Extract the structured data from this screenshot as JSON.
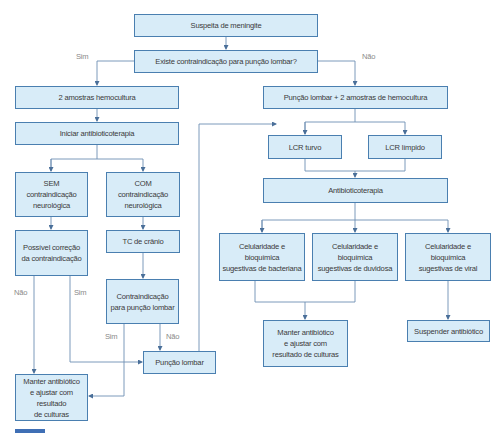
{
  "colors": {
    "box_fill": "#d8ecf8",
    "box_border": "#4a7fb0",
    "line": "#4a6f99",
    "text": "#3a3a3a",
    "label": "#8a8a8a"
  },
  "nodes": {
    "suspeita": "Suspeita de meningite",
    "contraindicacao_pl": "Existe contraindicação para punção lombar?",
    "hemocultura_2": "2 amostras hemocultura",
    "iniciar_atb": "Iniciar antibioticoterapia",
    "sem_contra": [
      "SEM",
      "contraindicação",
      "neurológica"
    ],
    "com_contra": [
      "COM",
      "contraindicação",
      "neurológica"
    ],
    "possivel_correcao": [
      "Possível correção",
      "da contraindicação"
    ],
    "tc_cranio": "TC de crânio",
    "contra_pl": [
      "Contraindicação",
      "para punção lombar"
    ],
    "puncao_lombar": "Punção lombar",
    "manter_left": [
      "Manter antibiótico",
      "e ajustar com resultado",
      "de culturas"
    ],
    "pl_hemocultura": "Punção lombar + 2 amostras de hemocultura",
    "lcr_turvo": "LCR turvo",
    "lcr_limpido": "LCR límpido",
    "antibioticoterapia": "Antibioticoterapia",
    "cel_bacteriana": [
      "Celularidade e bioquímica",
      "sugestivas de bacteriana"
    ],
    "cel_duvidosa": [
      "Celularidade e bioquímica",
      "sugestivas de duvidosa"
    ],
    "cel_viral": [
      "Celularidade e bioquímica",
      "sugestivas de viral"
    ],
    "manter_right": [
      "Manter antibiótico",
      "e ajustar com",
      "resultado de culturas"
    ],
    "suspender": "Suspender antibiótico"
  },
  "edge_labels": {
    "sim_top": "Sim",
    "nao_top": "Não",
    "nao_left": "Não",
    "sim_left": "Sim",
    "sim_contra": "Sim",
    "nao_contra": "Não"
  }
}
